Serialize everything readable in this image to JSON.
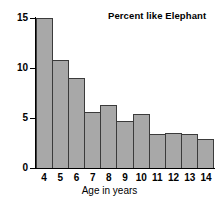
{
  "chart_data": {
    "type": "bar",
    "title": "Percent like Elephant",
    "xlabel": "Age in years",
    "ylabel": "",
    "categories": [
      "4",
      "5",
      "6",
      "7",
      "8",
      "9",
      "10",
      "11",
      "12",
      "13",
      "14"
    ],
    "values": [
      15.0,
      10.8,
      9.0,
      5.6,
      6.3,
      4.7,
      5.4,
      3.4,
      3.5,
      3.4,
      2.9
    ],
    "ylim": [
      0,
      15
    ],
    "xlim": [
      4,
      14
    ],
    "yticks": [
      0,
      5,
      10,
      15
    ],
    "ytick_labels": [
      "0",
      "5",
      "10",
      "15"
    ],
    "grid": false,
    "legend": false,
    "bar_fill_color": "#a8a8a8",
    "bar_edge_color": "#3b3b3b",
    "axis_color": "#000000",
    "background_color": "#ffffff"
  }
}
